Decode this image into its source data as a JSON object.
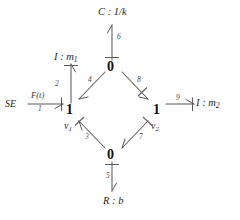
{
  "diagram": {
    "kind": "bond-graph",
    "title": "",
    "background_color": "#ffffff",
    "line_color": "#5b5b5b",
    "text_color": "#1d1d1d",
    "junctions": [
      {
        "id": "zero-top",
        "symbol": "0",
        "x": 112,
        "y": 66
      },
      {
        "id": "one-left",
        "symbol": "1",
        "x": 70,
        "y": 110
      },
      {
        "id": "one-right",
        "symbol": "1",
        "x": 157,
        "y": 110
      },
      {
        "id": "zero-bottom",
        "symbol": "0",
        "x": 112,
        "y": 155
      }
    ],
    "velocity_labels": [
      {
        "id": "v1",
        "base": "v",
        "subscript": "1",
        "x": 66,
        "y": 123
      },
      {
        "id": "v2",
        "base": "v",
        "subscript": "2",
        "x": 153,
        "y": 123
      }
    ],
    "elements": [
      {
        "id": "capacitor",
        "base": "C",
        "separator": " : ",
        "value": "1/k",
        "subscript": "",
        "x": 98,
        "y": 7
      },
      {
        "id": "inertia-1",
        "base": "I",
        "separator": " : ",
        "value": "m",
        "subscript": "1",
        "x": 54,
        "y": 52
      },
      {
        "id": "inertia-2",
        "base": "I",
        "separator": " : ",
        "value": "m",
        "subscript": "2",
        "x": 196,
        "y": 102
      },
      {
        "id": "resistor",
        "base": "R",
        "separator": " : ",
        "value": "b",
        "subscript": "",
        "x": 103,
        "y": 196
      }
    ],
    "source": {
      "id": "effort-source",
      "label": "SE",
      "x": 5,
      "y": 101,
      "effort_label": "F(t)",
      "effort_label_x": 31,
      "effort_label_y": 93
    },
    "bonds": [
      {
        "num": "1",
        "from": "effort-source",
        "to": "one-left",
        "label_x": 38,
        "label_y": 110
      },
      {
        "num": "2",
        "from": "one-left",
        "to": "inertia-1",
        "label_x": 55,
        "label_y": 82
      },
      {
        "num": "3",
        "from": "zero-bottom",
        "to": "one-left",
        "label_x": 85,
        "label_y": 137
      },
      {
        "num": "4",
        "from": "zero-top",
        "to": "one-left",
        "label_x": 88,
        "label_y": 80
      },
      {
        "num": "5",
        "from": "zero-bottom",
        "to": "resistor",
        "label_x": 106,
        "label_y": 175
      },
      {
        "num": "6",
        "from": "zero-top",
        "to": "capacitor",
        "label_x": 117,
        "label_y": 36
      },
      {
        "num": "7",
        "from": "one-right",
        "to": "zero-bottom",
        "label_x": 141,
        "label_y": 137
      },
      {
        "num": "8",
        "from": "zero-top",
        "to": "one-right",
        "label_x": 139,
        "label_y": 79
      },
      {
        "num": "9",
        "from": "one-right",
        "to": "inertia-2",
        "label_x": 177,
        "label_y": 96
      }
    ]
  }
}
